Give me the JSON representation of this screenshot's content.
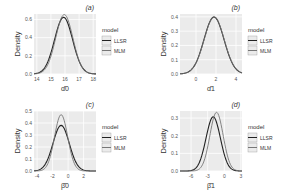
{
  "chart_data": [
    {
      "type": "line",
      "panel": "(a)",
      "title": "(a)",
      "xlabel": "α̂0",
      "ylabel": "Density",
      "xticks": [
        14,
        15,
        16,
        17,
        18
      ],
      "yticks": [
        0.0,
        0.2,
        0.4,
        0.6
      ],
      "xlim": [
        13.8,
        18.2
      ],
      "ylim": [
        0,
        0.66
      ],
      "legend": {
        "title": "model",
        "entries": [
          "LLSR",
          "MLM"
        ],
        "position": "right"
      },
      "series": [
        {
          "name": "LLSR",
          "dist": {
            "mean": 15.9,
            "sd": 0.64
          }
        },
        {
          "name": "MLM",
          "dist": {
            "mean": 15.95,
            "sd": 0.61
          }
        }
      ],
      "grid": true
    },
    {
      "type": "line",
      "panel": "(b)",
      "title": "(b)",
      "xlabel": "α̂1",
      "ylabel": "Density",
      "xticks": [
        0,
        2,
        4
      ],
      "yticks": [
        0.0,
        0.1,
        0.2,
        0.3,
        0.4
      ],
      "xlim": [
        -1.6,
        4.6
      ],
      "ylim": [
        0,
        0.42
      ],
      "legend": {
        "title": "model",
        "entries": [
          "LLSR",
          "MLM"
        ],
        "position": "right"
      },
      "series": [
        {
          "name": "LLSR",
          "dist": {
            "mean": 1.8,
            "sd": 1.0
          }
        },
        {
          "name": "MLM",
          "dist": {
            "mean": 1.82,
            "sd": 1.0
          }
        }
      ],
      "grid": true
    },
    {
      "type": "line",
      "panel": "(c)",
      "title": "(c)",
      "xlabel": "β̂0",
      "ylabel": "Density",
      "xticks": [
        -4,
        -2,
        0,
        2
      ],
      "yticks": [
        0.0,
        0.1,
        0.2,
        0.3,
        0.4,
        0.5
      ],
      "xlim": [
        -4.4,
        3.6
      ],
      "ylim": [
        0,
        0.5
      ],
      "legend": {
        "title": "model",
        "entries": [
          "LLSR",
          "MLM"
        ],
        "position": "right"
      },
      "series": [
        {
          "name": "LLSR",
          "dist": {
            "mean": -0.9,
            "sd": 1.05
          }
        },
        {
          "name": "MLM",
          "dist": {
            "mean": -0.9,
            "sd": 0.85
          }
        }
      ],
      "grid": true
    },
    {
      "type": "line",
      "panel": "(d)",
      "title": "(d)",
      "xlabel": "β̂1",
      "ylabel": "Density",
      "xticks": [
        -6,
        -3,
        0,
        3
      ],
      "yticks": [
        0.0,
        0.1,
        0.2,
        0.3
      ],
      "xlim": [
        -8,
        3.2
      ],
      "ylim": [
        0,
        0.34
      ],
      "legend": {
        "title": "model",
        "entries": [
          "LLSR",
          "MLM"
        ],
        "position": "right"
      },
      "series": [
        {
          "name": "LLSR",
          "dist": {
            "mean": -2.0,
            "sd": 1.3
          }
        },
        {
          "name": "MLM",
          "dist": {
            "mean": -1.4,
            "sd": 1.2
          }
        }
      ],
      "grid": true
    }
  ],
  "colors": {
    "panel_bg": "#ebebeb",
    "grid": "#ffffff",
    "llsr": "#222222",
    "mlm": "#777777",
    "text": "#333333",
    "tick": "#555555"
  }
}
